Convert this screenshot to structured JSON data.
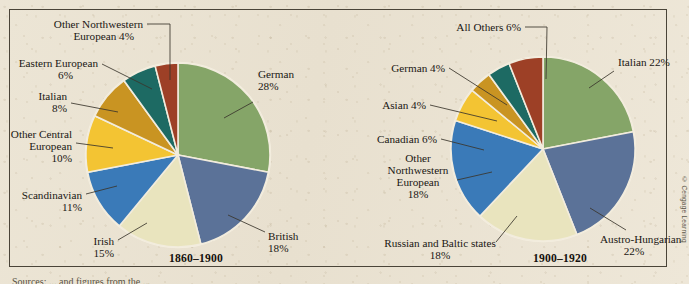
{
  "figure": {
    "background_color": "#ebe4d4",
    "frame_color": "#4a4438",
    "credit": "© Cengage Learning",
    "footnote_cut": "Sources: ... and figures from the ..."
  },
  "palette": {
    "green": "#85a568",
    "slate_blue": "#5b7298",
    "cream": "#e9e4be",
    "bright_blue": "#3a7ab8",
    "yellow": "#f3c433",
    "ochre": "#c99422",
    "teal": "#1d6a63",
    "dark_red": "#9d4026",
    "slice_border": "#f2ecdd"
  },
  "chart_data": [
    {
      "type": "pie",
      "title": "1860–1900",
      "id": "left",
      "center": [
        178,
        155
      ],
      "radius": 92,
      "start_angle_deg": -90,
      "direction": "clockwise",
      "categories": [
        "German",
        "British",
        "Irish",
        "Scandinavian",
        "Other Central European",
        "Italian",
        "Eastern European",
        "Other Northwestern European"
      ],
      "values": [
        28,
        18,
        15,
        11,
        10,
        8,
        6,
        4
      ],
      "colors": [
        "#85a568",
        "#5b7298",
        "#e9e4be",
        "#3a7ab8",
        "#f3c433",
        "#c99422",
        "#1d6a63",
        "#9d4026"
      ],
      "labels": [
        {
          "lines": [
            "German",
            "28%"
          ],
          "pct": "28%"
        },
        {
          "lines": [
            "British",
            "18%"
          ],
          "pct": "18%"
        },
        {
          "lines": [
            "Irish",
            "15%"
          ],
          "pct": "15%"
        },
        {
          "lines": [
            "Scandinavian",
            "11%"
          ],
          "pct": "11%"
        },
        {
          "lines": [
            "Other Central",
            "European",
            "10%"
          ],
          "pct": "10%"
        },
        {
          "lines": [
            "Italian",
            "8%"
          ],
          "pct": "8%"
        },
        {
          "lines": [
            "Eastern European",
            "6%"
          ],
          "pct": "6%"
        },
        {
          "lines": [
            "Other Northwestern",
            "European 4%"
          ],
          "pct": "4%"
        }
      ]
    },
    {
      "type": "pie",
      "title": "1900–1920",
      "id": "right",
      "center": [
        543,
        149
      ],
      "radius": 92,
      "start_angle_deg": -90,
      "direction": "clockwise",
      "categories": [
        "Italian",
        "Austro-Hungarian",
        "Russian and Baltic states",
        "Other Northwestern European",
        "Canadian",
        "Asian",
        "German",
        "All Others"
      ],
      "values": [
        22,
        22,
        18,
        18,
        6,
        4,
        4,
        6
      ],
      "colors": [
        "#85a568",
        "#5b7298",
        "#e9e4be",
        "#3a7ab8",
        "#f3c433",
        "#c99422",
        "#1d6a63",
        "#9d4026"
      ],
      "labels": [
        {
          "lines": [
            "Italian 22%"
          ],
          "pct": "22%"
        },
        {
          "lines": [
            "Austro-Hungarian",
            "22%"
          ],
          "pct": "22%"
        },
        {
          "lines": [
            "Russian and Baltic states",
            "18%"
          ],
          "pct": "18%"
        },
        {
          "lines": [
            "Other",
            "Northwestern",
            "European",
            "18%"
          ],
          "pct": "18%"
        },
        {
          "lines": [
            "Canadian 6%"
          ],
          "pct": "6%"
        },
        {
          "lines": [
            "Asian 4%"
          ],
          "pct": "4%"
        },
        {
          "lines": [
            "German 4%"
          ],
          "pct": "4%"
        },
        {
          "lines": [
            "All Others 6%"
          ],
          "pct": "6%"
        }
      ]
    }
  ],
  "labels_left": {
    "l0": {
      "t1": "German",
      "t2": "28%"
    },
    "l1": {
      "t1": "British",
      "t2": "18%"
    },
    "l2": {
      "t1": "Irish",
      "t2": "15%"
    },
    "l3": {
      "t1": "Scandinavian",
      "t2": "11%"
    },
    "l4": {
      "t1": "Other Central",
      "t2": "European",
      "t3": "10%"
    },
    "l5": {
      "t1": "Italian",
      "t2": "8%"
    },
    "l6": {
      "t1": "Eastern European",
      "t2": "6%"
    },
    "l7": {
      "t1": "Other Northwestern",
      "t2": "European 4%"
    },
    "period": "1860–1900"
  },
  "labels_right": {
    "r0": {
      "t1": "Italian 22%"
    },
    "r1": {
      "t1": "Austro-Hungarian",
      "t2": "22%"
    },
    "r2": {
      "t1": "Russian and Baltic states",
      "t2": "18%"
    },
    "r3": {
      "t1": "Other",
      "t2": "Northwestern",
      "t3": "European",
      "t4": "18%"
    },
    "r4": {
      "t1": "Canadian 6%"
    },
    "r5": {
      "t1": "Asian 4%"
    },
    "r6": {
      "t1": "German 4%"
    },
    "r7": {
      "t1": "All Others 6%"
    },
    "period": "1900–1920"
  }
}
